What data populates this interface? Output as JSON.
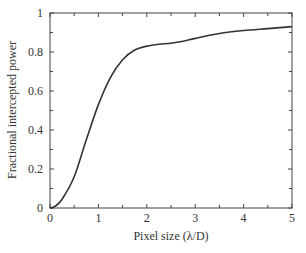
{
  "chart_data": {
    "type": "line",
    "title": "",
    "xlabel": "Pixel size (λ/D)",
    "ylabel": "Fractional intercepted power",
    "xlim": [
      0,
      5
    ],
    "ylim": [
      0,
      1
    ],
    "grid": false,
    "legend": null,
    "x_ticks": [
      "0",
      "1",
      "2",
      "3",
      "4",
      "5"
    ],
    "y_ticks": [
      "0",
      "0.2",
      "0.4",
      "0.6",
      "0.8",
      "1"
    ],
    "series": [
      {
        "name": "Fractional intercepted power",
        "color": "#333333",
        "x": [
          0,
          0.1,
          0.25,
          0.5,
          0.75,
          1.0,
          1.25,
          1.5,
          1.75,
          2.0,
          2.25,
          2.5,
          2.75,
          3.0,
          3.5,
          4.0,
          4.5,
          5.0
        ],
        "y": [
          0,
          0.008,
          0.045,
          0.16,
          0.35,
          0.53,
          0.67,
          0.76,
          0.81,
          0.83,
          0.84,
          0.845,
          0.855,
          0.87,
          0.895,
          0.91,
          0.92,
          0.93
        ]
      }
    ]
  }
}
